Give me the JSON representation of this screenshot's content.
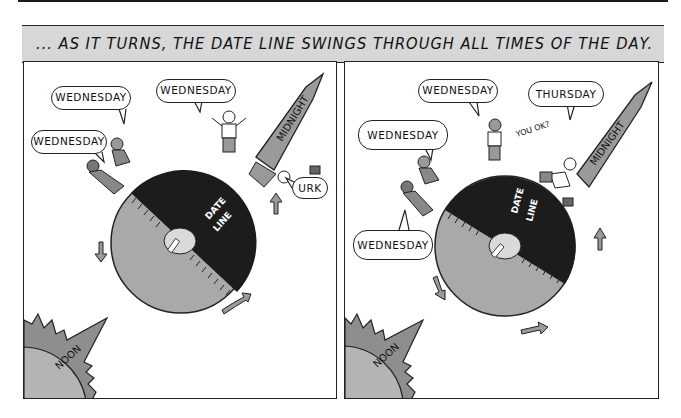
{
  "caption": {
    "text": "... AS IT TURNS, THE DATE LINE SWINGS THROUGH ALL TIMES OF THE DAY."
  },
  "panels": [
    {
      "name": "left",
      "bubbles": [
        {
          "text": "WEDNESDAY"
        },
        {
          "text": "WEDNESDAY"
        },
        {
          "text": "WEDNESDAY"
        },
        {
          "text": "URK"
        }
      ],
      "globe_label": [
        "DATE",
        "LINE"
      ],
      "midnight_label": "MIDNIGHT",
      "noon_label": "NOON"
    },
    {
      "name": "right",
      "bubbles": [
        {
          "text": "WEDNESDAY"
        },
        {
          "text": "WEDNESDAY"
        },
        {
          "text": "THURSDAY"
        },
        {
          "text": "WEDNESDAY"
        }
      ],
      "aside": "YOU OK?",
      "globe_label": [
        "DATE",
        "LINE"
      ],
      "midnight_label": "MIDNIGHT",
      "noon_label": "NOON"
    }
  ],
  "colors": {
    "night": "#1c1c1c",
    "day": "#a9a9a9",
    "banner": "#9a9a9a",
    "sun_outer": "#8e8e8e",
    "sun_inner": "#b4b4b4",
    "caption_bg": "#d7d7d7"
  }
}
